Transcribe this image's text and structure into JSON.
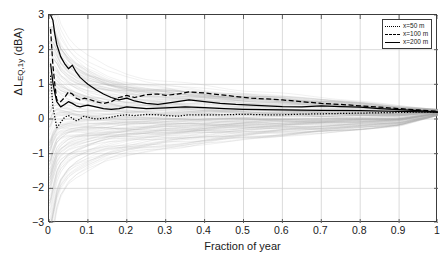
{
  "chart_data": {
    "type": "line",
    "title": "",
    "xlabel": "Fraction of year",
    "ylabel_parts": {
      "delta": "Δ",
      "symbol": "L",
      "subscript": "EQ,1y",
      "units": "(dBA)"
    },
    "ylabel": "Δ L_EQ,1y (dBA)",
    "xlim": [
      0,
      1
    ],
    "ylim": [
      -3,
      3
    ],
    "grid": true,
    "xticks": [
      0,
      0.1,
      0.2,
      0.3,
      0.4,
      0.5,
      0.6,
      0.7,
      0.8,
      0.9,
      1
    ],
    "xticklabels": [
      "0",
      "0.1",
      "0.2",
      "0.3",
      "0.4",
      "0.5",
      "0.6",
      "0.7",
      "0.8",
      "0.9",
      "1"
    ],
    "yticks": [
      -3,
      -2,
      -1,
      0,
      1,
      2,
      3
    ],
    "yticklabels": [
      "-3",
      "-2",
      "-1",
      "0",
      "1",
      "2",
      "3"
    ],
    "legend_position": "top-right",
    "legend": [
      {
        "label": "x=50 m",
        "style": "dotted",
        "color": "#000000"
      },
      {
        "label": "x=100 m",
        "style": "dashed",
        "color": "#000000"
      },
      {
        "label": "x=200 m",
        "style": "solid",
        "color": "#000000"
      }
    ],
    "background_cloud": {
      "description": "dense gray ensemble of individual yearly realizations converging with increasing fraction of year",
      "color": "#a8a8a8",
      "upper_envelope": {
        "x": [
          0.003,
          0.01,
          0.02,
          0.03,
          0.05,
          0.07,
          0.1,
          0.15,
          0.2,
          0.25,
          0.3,
          0.35,
          0.4,
          0.5,
          0.6,
          0.7,
          0.8,
          0.9,
          1.0
        ],
        "y": [
          3.0,
          3.0,
          2.65,
          2.3,
          1.95,
          1.72,
          1.5,
          1.25,
          1.1,
          1.0,
          0.95,
          0.9,
          0.85,
          0.75,
          0.68,
          0.6,
          0.5,
          0.38,
          0.28
        ]
      },
      "lower_envelope": {
        "x": [
          0.003,
          0.01,
          0.02,
          0.03,
          0.05,
          0.07,
          0.1,
          0.15,
          0.2,
          0.25,
          0.3,
          0.35,
          0.4,
          0.5,
          0.6,
          0.7,
          0.8,
          0.9,
          1.0
        ],
        "y": [
          -3.0,
          -2.6,
          -2.05,
          -1.75,
          -1.45,
          -1.3,
          -1.15,
          -0.95,
          -0.85,
          -0.78,
          -0.72,
          -0.68,
          -0.62,
          -0.52,
          -0.45,
          -0.38,
          -0.3,
          -0.2,
          0.1
        ]
      }
    },
    "series": [
      {
        "name": "x=50 m",
        "style": "dotted",
        "color": "#000000",
        "x": [
          0.004,
          0.01,
          0.015,
          0.02,
          0.03,
          0.04,
          0.05,
          0.06,
          0.07,
          0.08,
          0.09,
          0.1,
          0.12,
          0.14,
          0.16,
          0.18,
          0.2,
          0.22,
          0.25,
          0.28,
          0.3,
          0.33,
          0.36,
          0.4,
          0.44,
          0.48,
          0.52,
          0.56,
          0.6,
          0.65,
          0.7,
          0.75,
          0.8,
          0.85,
          0.9,
          0.95,
          1.0
        ],
        "y": [
          1.25,
          0.35,
          0.05,
          -0.25,
          -0.1,
          0.05,
          0.1,
          0.02,
          -0.05,
          0.0,
          0.08,
          0.05,
          0.0,
          0.02,
          0.05,
          0.1,
          0.12,
          0.1,
          0.13,
          0.12,
          0.1,
          0.08,
          0.12,
          0.12,
          0.12,
          0.13,
          0.13,
          0.12,
          0.12,
          0.14,
          0.15,
          0.16,
          0.17,
          0.18,
          0.19,
          0.2,
          0.2
        ]
      },
      {
        "name": "x=100 m",
        "style": "dashed",
        "color": "#000000",
        "x": [
          0.004,
          0.01,
          0.015,
          0.02,
          0.03,
          0.04,
          0.05,
          0.06,
          0.07,
          0.08,
          0.09,
          0.1,
          0.12,
          0.14,
          0.16,
          0.18,
          0.2,
          0.22,
          0.25,
          0.28,
          0.3,
          0.33,
          0.36,
          0.4,
          0.44,
          0.48,
          0.52,
          0.56,
          0.6,
          0.65,
          0.7,
          0.75,
          0.8,
          0.85,
          0.9,
          0.95,
          1.0
        ],
        "y": [
          2.6,
          1.55,
          1.0,
          0.55,
          0.5,
          0.62,
          0.78,
          0.72,
          0.6,
          0.55,
          0.6,
          0.58,
          0.5,
          0.45,
          0.5,
          0.62,
          0.68,
          0.62,
          0.7,
          0.72,
          0.68,
          0.72,
          0.78,
          0.75,
          0.7,
          0.65,
          0.6,
          0.58,
          0.55,
          0.5,
          0.45,
          0.42,
          0.38,
          0.34,
          0.3,
          0.26,
          0.22
        ]
      },
      {
        "name": "x=200 m",
        "style": "solid",
        "color": "#000000",
        "x": [
          0.004,
          0.01,
          0.015,
          0.02,
          0.03,
          0.04,
          0.05,
          0.06,
          0.07,
          0.08,
          0.09,
          0.1,
          0.12,
          0.14,
          0.16,
          0.18,
          0.2,
          0.22,
          0.25,
          0.28,
          0.3,
          0.33,
          0.36,
          0.4,
          0.44,
          0.48,
          0.52,
          0.56,
          0.6,
          0.65,
          0.7,
          0.75,
          0.8,
          0.85,
          0.9,
          0.95,
          1.0
        ],
        "y": [
          3.0,
          2.85,
          2.45,
          2.15,
          1.8,
          1.6,
          1.45,
          1.55,
          1.35,
          1.2,
          1.1,
          1.0,
          0.85,
          0.72,
          0.62,
          0.55,
          0.6,
          0.52,
          0.45,
          0.42,
          0.45,
          0.5,
          0.55,
          0.5,
          0.45,
          0.42,
          0.4,
          0.38,
          0.36,
          0.35,
          0.38,
          0.36,
          0.34,
          0.3,
          0.27,
          0.24,
          0.2
        ]
      },
      {
        "name": "x=200 m lower branch",
        "style": "solid",
        "color": "#000000",
        "x": [
          0.004,
          0.01,
          0.015,
          0.02,
          0.03,
          0.04,
          0.05,
          0.06,
          0.07,
          0.08,
          0.09,
          0.1,
          0.12,
          0.14,
          0.16,
          0.18,
          0.2,
          0.25,
          0.3,
          0.35,
          0.4,
          0.45,
          0.5,
          0.6,
          0.7,
          0.8,
          0.9,
          1.0
        ],
        "y": [
          1.6,
          1.05,
          0.75,
          0.5,
          0.35,
          0.42,
          0.5,
          0.45,
          0.38,
          0.35,
          0.38,
          0.4,
          0.35,
          0.3,
          0.28,
          0.3,
          0.35,
          0.3,
          0.32,
          0.35,
          0.33,
          0.3,
          0.28,
          0.26,
          0.25,
          0.24,
          0.22,
          0.2
        ]
      }
    ]
  }
}
